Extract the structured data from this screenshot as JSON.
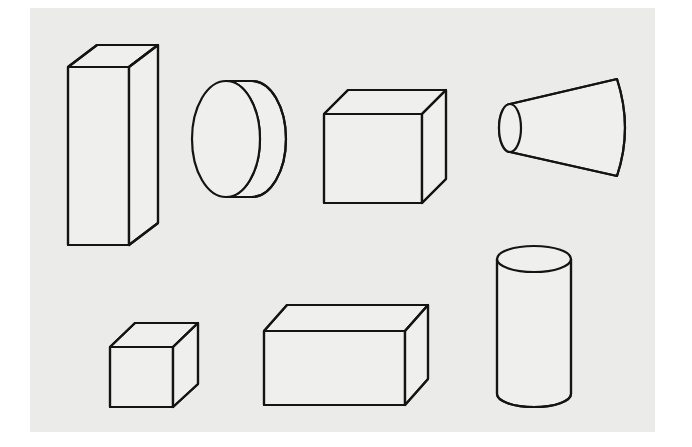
{
  "figure": {
    "title": "Line drawings of eight geometric solids",
    "background_color": "#ffffff",
    "paper_color": "#ebebe9",
    "ink_color": "#141414",
    "face_fill_color": "#efefed",
    "paper_region": {
      "x": 30,
      "y": 8,
      "width": 625,
      "height": 424
    },
    "rows": [
      {
        "label": "top-row",
        "count": 4
      },
      {
        "label": "bottom-row",
        "count": 3
      }
    ],
    "shapes": [
      {
        "id": "tall-rectangular-prism",
        "name": "Tall rectangular prism",
        "row": "top-row",
        "position": 1,
        "type": "box",
        "front": {
          "x": 68,
          "y": 67,
          "width": 61,
          "height": 178
        },
        "depth": {
          "dx": 29,
          "dy": -22
        }
      },
      {
        "id": "disc-cylinder",
        "name": "Short cylinder seen end-on (disc)",
        "row": "top-row",
        "position": 2,
        "type": "cylinder-horizontal",
        "front_ellipse": {
          "cx": 226,
          "cy": 139,
          "rx": 34,
          "ry": 58
        },
        "back_ellipse": {
          "cx": 252,
          "cy": 139,
          "rx": 34,
          "ry": 58
        }
      },
      {
        "id": "cube-large",
        "name": "Cube",
        "row": "top-row",
        "position": 3,
        "type": "box",
        "front": {
          "x": 324,
          "y": 114,
          "width": 98,
          "height": 89
        },
        "depth": {
          "dx": 24,
          "dy": -24
        }
      },
      {
        "id": "truncated-cone",
        "name": "Truncated cone (frustum) pointing left",
        "row": "top-row",
        "position": 4,
        "type": "frustum-horizontal",
        "small_ellipse": {
          "cx": 510,
          "cy": 128,
          "rx": 11,
          "ry": 24
        },
        "large_end": {
          "x": 617,
          "top_y": 79,
          "bottom_y": 176,
          "bulge": 16
        }
      },
      {
        "id": "cube-small",
        "name": "Small cube",
        "row": "bottom-row",
        "position": 1,
        "type": "box",
        "front": {
          "x": 110,
          "y": 347,
          "width": 63,
          "height": 60
        },
        "depth": {
          "dx": 25,
          "dy": -24
        }
      },
      {
        "id": "wide-rectangular-box",
        "name": "Wide rectangular box",
        "row": "bottom-row",
        "position": 2,
        "type": "box",
        "front": {
          "x": 264,
          "y": 331,
          "width": 141,
          "height": 74
        },
        "depth": {
          "dx": 23,
          "dy": -26
        }
      },
      {
        "id": "upright-cylinder",
        "name": "Upright cylinder",
        "row": "bottom-row",
        "position": 3,
        "type": "cylinder-vertical",
        "top_ellipse": {
          "cx": 534,
          "cy": 259,
          "rx": 37,
          "ry": 13
        },
        "bottom_ellipse": {
          "cx": 534,
          "cy": 394,
          "rx": 37,
          "ry": 13
        },
        "body_height": 135
      }
    ]
  }
}
